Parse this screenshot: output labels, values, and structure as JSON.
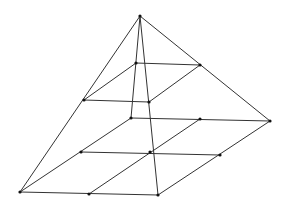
{
  "diagram": {
    "title": "",
    "colors": {
      "edge": "#333333",
      "vertex": "#111111",
      "background": "#ffffff"
    },
    "vertices": [
      {
        "id": "apex",
        "x": 140,
        "y": 16
      },
      {
        "id": "upper-back",
        "x": 136,
        "y": 63
      },
      {
        "id": "upper-right",
        "x": 200,
        "y": 65
      },
      {
        "id": "upper-left",
        "x": 84,
        "y": 100
      },
      {
        "id": "upper-front",
        "x": 149,
        "y": 102
      },
      {
        "id": "base-back",
        "x": 131,
        "y": 118
      },
      {
        "id": "base-back-right-mid",
        "x": 200,
        "y": 119
      },
      {
        "id": "base-right",
        "x": 270,
        "y": 121
      },
      {
        "id": "base-left-back-mid",
        "x": 81,
        "y": 152
      },
      {
        "id": "base-center",
        "x": 150,
        "y": 152
      },
      {
        "id": "base-right-front-mid",
        "x": 220,
        "y": 155
      },
      {
        "id": "base-left",
        "x": 20,
        "y": 192
      },
      {
        "id": "base-left-front-mid",
        "x": 89,
        "y": 194
      },
      {
        "id": "base-front",
        "x": 158,
        "y": 195
      }
    ],
    "edges": [
      [
        "apex",
        "base-left"
      ],
      [
        "apex",
        "base-right"
      ],
      [
        "apex",
        "base-front"
      ],
      [
        "apex",
        "base-back"
      ],
      [
        "upper-back",
        "upper-right"
      ],
      [
        "upper-back",
        "upper-left"
      ],
      [
        "upper-left",
        "upper-front"
      ],
      [
        "upper-front",
        "upper-right"
      ],
      [
        "base-left",
        "base-front"
      ],
      [
        "base-back",
        "base-right"
      ],
      [
        "base-left",
        "base-back"
      ],
      [
        "base-front",
        "base-right"
      ],
      [
        "base-left-back-mid",
        "base-right-front-mid"
      ],
      [
        "base-left-front-mid",
        "base-back-right-mid"
      ]
    ]
  }
}
